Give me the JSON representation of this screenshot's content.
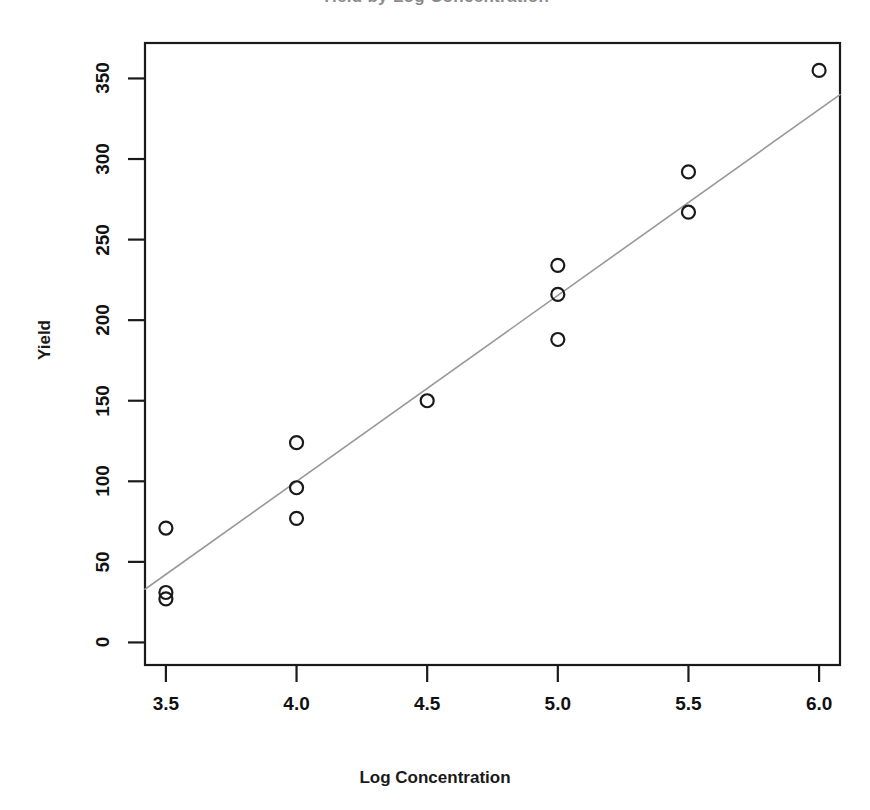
{
  "figure": {
    "background_color": "#ffffff",
    "clipped_title": "Yield by Log Concentration"
  },
  "chart_data": {
    "type": "scatter",
    "title": "",
    "xlabel": "Log Concentration",
    "ylabel": "Yield",
    "xlim": [
      3.42,
      6.08
    ],
    "ylim": [
      -14,
      372
    ],
    "grid": false,
    "legend": null,
    "marker": {
      "shape": "open-circle",
      "color": "#1a1a1a",
      "fill": "none",
      "size_px": 13,
      "stroke_width": 2.2
    },
    "xticks": [
      3.5,
      4.0,
      4.5,
      5.0,
      5.5,
      6.0
    ],
    "xtick_labels": [
      "3.5",
      "4.0",
      "4.5",
      "5.0",
      "5.5",
      "6.0"
    ],
    "yticks": [
      0,
      50,
      100,
      150,
      200,
      250,
      300,
      350
    ],
    "ytick_labels": [
      "0",
      "50",
      "100",
      "150",
      "200",
      "250",
      "300",
      "350"
    ],
    "x": [
      3.5,
      3.5,
      3.5,
      4.0,
      4.0,
      4.0,
      4.5,
      5.0,
      5.0,
      5.0,
      5.5,
      5.5,
      6.0
    ],
    "y": [
      71,
      31,
      27,
      124,
      96,
      77,
      150,
      234,
      216,
      188,
      292,
      267,
      355
    ],
    "points": [
      {
        "x": 3.5,
        "y": 71
      },
      {
        "x": 3.5,
        "y": 31
      },
      {
        "x": 3.5,
        "y": 27
      },
      {
        "x": 4.0,
        "y": 124
      },
      {
        "x": 4.0,
        "y": 96
      },
      {
        "x": 4.0,
        "y": 77
      },
      {
        "x": 4.5,
        "y": 150
      },
      {
        "x": 5.0,
        "y": 234
      },
      {
        "x": 5.0,
        "y": 216
      },
      {
        "x": 5.0,
        "y": 188
      },
      {
        "x": 5.5,
        "y": 292
      },
      {
        "x": 5.5,
        "y": 267
      },
      {
        "x": 6.0,
        "y": 355
      }
    ],
    "fit_line": {
      "name": "regression-line",
      "color": "#999999",
      "stroke_width": 1.6,
      "x_start": 3.42,
      "y_start": 33,
      "x_end": 6.08,
      "y_end": 340,
      "slope": 115.4,
      "intercept": -361.7
    },
    "frame": {
      "color": "#1a1a1a",
      "stroke_width": 2.2,
      "left_px": 145,
      "right_px": 840,
      "top_px": 43,
      "bottom_px": 665
    }
  }
}
